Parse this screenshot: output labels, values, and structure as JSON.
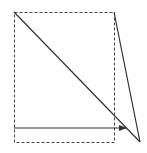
{
  "diagram": {
    "background": "#ffffff",
    "stroke_color": "#333333",
    "dashed_rect": {
      "x": 14,
      "y": 12,
      "width": 100,
      "height": 130,
      "dash": "3,2",
      "stroke": "#444444"
    },
    "diagonal_line": {
      "x1": 14,
      "y1": 12,
      "x2": 140,
      "y2": 142,
      "stroke": "#333333"
    },
    "right_edge_line": {
      "x1": 114,
      "y1": 12,
      "x2": 140,
      "y2": 142,
      "stroke": "#333333"
    },
    "arrow": {
      "x1": 14,
      "y1": 128,
      "x2": 126,
      "y2": 128,
      "stroke": "#333333",
      "head": "filled-triangle"
    }
  }
}
